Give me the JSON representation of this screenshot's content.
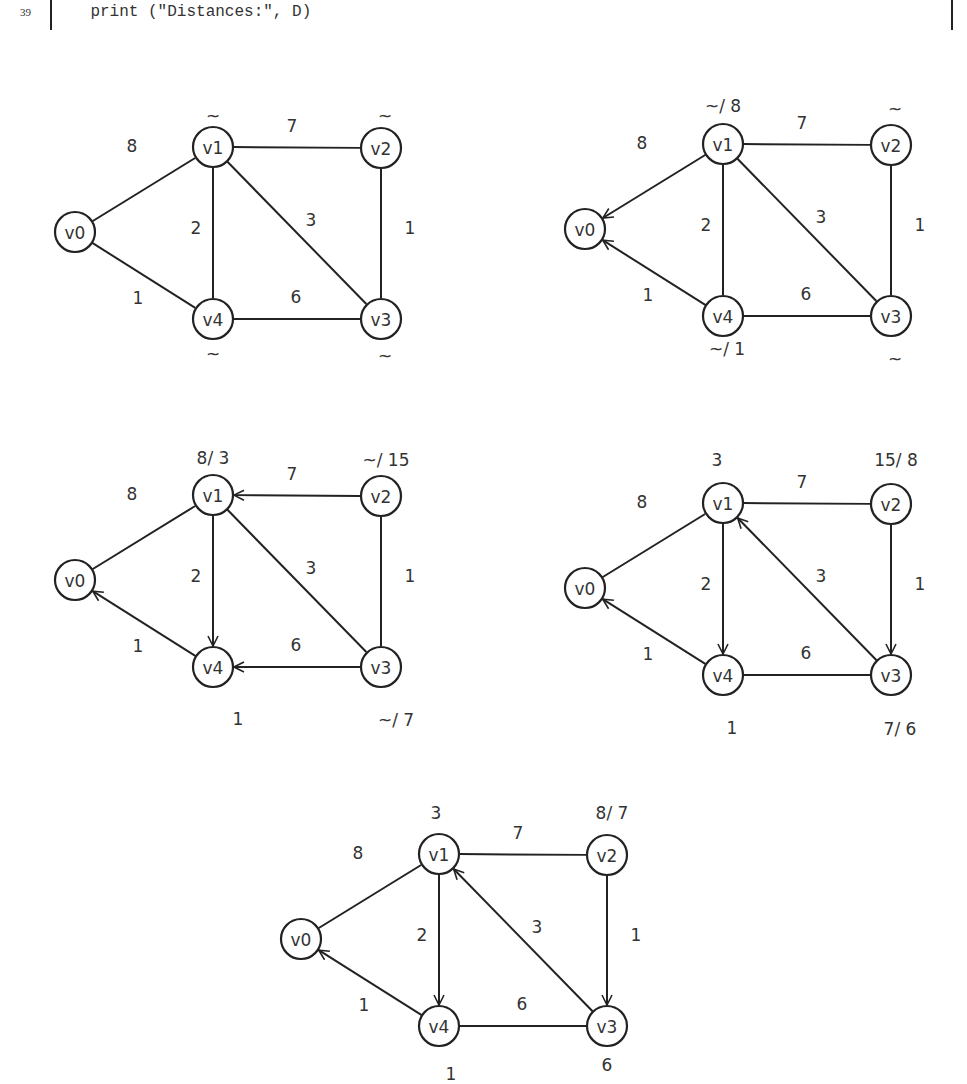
{
  "code": {
    "line_number": "39",
    "text": "    print (\"Distances:\", D)"
  },
  "node_layout": {
    "v0": [
      75,
      232
    ],
    "v1": [
      213,
      147
    ],
    "v2": [
      381,
      148
    ],
    "v3": [
      381,
      319
    ],
    "v4": [
      213,
      319
    ]
  },
  "node_radius": 20,
  "edges": [
    {
      "from": "v0",
      "to": "v1",
      "weight": "8",
      "label_pos": [
        132,
        146
      ]
    },
    {
      "from": "v0",
      "to": "v4",
      "weight": "1",
      "label_pos": [
        138,
        298
      ]
    },
    {
      "from": "v1",
      "to": "v2",
      "weight": "7",
      "label_pos": [
        292,
        126
      ]
    },
    {
      "from": "v1",
      "to": "v4",
      "weight": "2",
      "label_pos": [
        196,
        228
      ]
    },
    {
      "from": "v1",
      "to": "v3",
      "weight": "3",
      "label_pos": [
        311,
        220
      ]
    },
    {
      "from": "v2",
      "to": "v3",
      "weight": "1",
      "label_pos": [
        410,
        228
      ]
    },
    {
      "from": "v4",
      "to": "v3",
      "weight": "6",
      "label_pos": [
        296,
        297
      ]
    }
  ],
  "graphs": [
    {
      "name": "step-0",
      "offset": [
        0,
        0
      ],
      "directed": [],
      "distances": [
        {
          "node": "v1",
          "text": "~",
          "pos": [
            213,
            116
          ]
        },
        {
          "node": "v2",
          "text": "~",
          "pos": [
            385,
            116
          ]
        },
        {
          "node": "v4",
          "text": "~",
          "pos": [
            213,
            354
          ]
        },
        {
          "node": "v3",
          "text": "~",
          "pos": [
            385,
            356
          ]
        }
      ]
    },
    {
      "name": "step-1",
      "offset": [
        510,
        -3
      ],
      "directed": [
        [
          "v1",
          "v0"
        ],
        [
          "v4",
          "v0"
        ]
      ],
      "distances": [
        {
          "node": "v1",
          "text": "~/ 8",
          "pos": [
            213,
            109
          ]
        },
        {
          "node": "v2",
          "text": "~",
          "pos": [
            385,
            112
          ]
        },
        {
          "node": "v4",
          "text": "~/ 1",
          "pos": [
            217,
            352
          ]
        },
        {
          "node": "v3",
          "text": "~",
          "pos": [
            385,
            362
          ]
        }
      ]
    },
    {
      "name": "step-2",
      "offset": [
        0,
        348
      ],
      "directed": [
        [
          "v2",
          "v1"
        ],
        [
          "v1",
          "v4"
        ],
        [
          "v3",
          "v4"
        ],
        [
          "v4",
          "v0"
        ]
      ],
      "distances": [
        {
          "node": "v1",
          "text": "8/ 3",
          "pos": [
            213,
            110
          ]
        },
        {
          "node": "v2",
          "text": "~/ 15",
          "pos": [
            386,
            112
          ]
        },
        {
          "node": "v4",
          "text": "1",
          "pos": [
            238,
            371
          ]
        },
        {
          "node": "v3",
          "text": "~/ 7",
          "pos": [
            396,
            372
          ]
        }
      ]
    },
    {
      "name": "step-3",
      "offset": [
        510,
        356
      ],
      "directed": [
        [
          "v1",
          "v4"
        ],
        [
          "v3",
          "v1"
        ],
        [
          "v2",
          "v3"
        ],
        [
          "v4",
          "v0"
        ]
      ],
      "distances": [
        {
          "node": "v1",
          "text": "3",
          "pos": [
            207,
            104
          ]
        },
        {
          "node": "v2",
          "text": "15/ 8",
          "pos": [
            386,
            104
          ]
        },
        {
          "node": "v4",
          "text": "1",
          "pos": [
            222,
            372
          ]
        },
        {
          "node": "v3",
          "text": "7/ 6",
          "pos": [
            390,
            373
          ]
        }
      ]
    },
    {
      "name": "step-4",
      "offset": [
        226,
        707
      ],
      "directed": [
        [
          "v1",
          "v4"
        ],
        [
          "v3",
          "v1"
        ],
        [
          "v2",
          "v3"
        ],
        [
          "v4",
          "v0"
        ]
      ],
      "distances": [
        {
          "node": "v1",
          "text": "3",
          "pos": [
            210,
            106
          ]
        },
        {
          "node": "v2",
          "text": "8/ 7",
          "pos": [
            386,
            106
          ]
        },
        {
          "node": "v4",
          "text": "1",
          "pos": [
            225,
            367
          ]
        },
        {
          "node": "v3",
          "text": "6",
          "pos": [
            381,
            358
          ]
        }
      ]
    }
  ],
  "node_names": [
    "v0",
    "v1",
    "v2",
    "v3",
    "v4"
  ]
}
